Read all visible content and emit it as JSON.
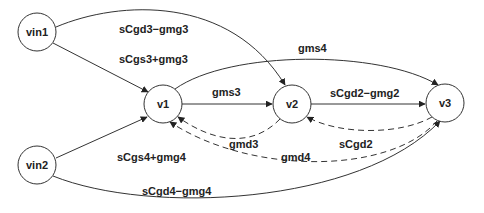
{
  "diagram": {
    "type": "signal-flow-graph",
    "nodes": [
      {
        "id": "vin1",
        "label": "vin1",
        "cx": 37,
        "cy": 32,
        "r": 19
      },
      {
        "id": "v1",
        "label": "v1",
        "cx": 163,
        "cy": 104,
        "r": 19
      },
      {
        "id": "v2",
        "label": "v2",
        "cx": 292,
        "cy": 104,
        "r": 19
      },
      {
        "id": "v3",
        "label": "v3",
        "cx": 445,
        "cy": 103,
        "r": 19
      },
      {
        "id": "vin2",
        "label": "vin2",
        "cx": 37,
        "cy": 165,
        "r": 19
      }
    ],
    "edges": [
      {
        "from": "vin1",
        "to": "v2",
        "label": "sCgd3−gmg3",
        "style": "solid"
      },
      {
        "from": "vin1",
        "to": "v1",
        "label": "sCgs3+gmg3",
        "style": "solid"
      },
      {
        "from": "v1",
        "to": "v3",
        "label": "gms4",
        "style": "solid"
      },
      {
        "from": "v1",
        "to": "v2",
        "label": "gms3",
        "style": "solid"
      },
      {
        "from": "v2",
        "to": "v3",
        "label": "sCgd2−gmg2",
        "style": "solid"
      },
      {
        "from": "v2",
        "to": "v1",
        "label": "gmd3",
        "style": "dashed"
      },
      {
        "from": "v3",
        "to": "v2",
        "label": "sCgd2",
        "style": "dashed"
      },
      {
        "from": "v3",
        "to": "v1",
        "label": "gmd4",
        "style": "dashed"
      },
      {
        "from": "vin2",
        "to": "v1",
        "label": "sCgs4+gmg4",
        "style": "solid"
      },
      {
        "from": "vin2",
        "to": "v3",
        "label": "sCgd4−gmg4",
        "style": "solid"
      }
    ]
  },
  "nodes": {
    "vin1": "vin1",
    "v1": "v1",
    "v2": "v2",
    "v3": "v3",
    "vin2": "vin2"
  },
  "edge_labels": {
    "vin1_v2": "sCgd3−gmg3",
    "vin1_v1": "sCgs3+gmg3",
    "v1_v3": "gms4",
    "v1_v2": "gms3",
    "v2_v3": "sCgd2−gmg2",
    "v2_v1": "gmd3",
    "v3_v2": "sCgd2",
    "v3_v1": "gmd4",
    "vin2_v1": "sCgs4+gmg4",
    "vin2_v3": "sCgd4−gmg4"
  }
}
